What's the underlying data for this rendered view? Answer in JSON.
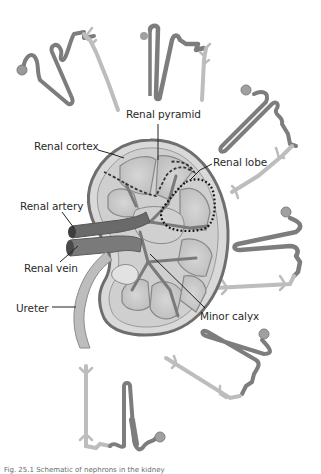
{
  "figure": {
    "labels": {
      "renal_pyramid": "Renal pyramid",
      "renal_cortex": "Renal cortex",
      "renal_lobe": "Renal lobe",
      "renal_artery": "Renal artery",
      "renal_vein": "Renal vein",
      "ureter": "Ureter",
      "minor_calyx": "Minor calyx"
    },
    "caption": "Fig. 25.1 Schematic of nephrons in the kidney"
  },
  "colors": {
    "background": "#ffffff",
    "nephron_dark": "#7a7a7a",
    "collecting_duct": "#b5b5b5",
    "capsule": "#6e6e6e",
    "cortex": "#dcdcdc",
    "pyramid": "#c9c9c9",
    "vessel": "#6b6b6b",
    "ureter": "#b8b8b8",
    "label_text": "#2a2a2a",
    "leader_line": "#222222"
  }
}
